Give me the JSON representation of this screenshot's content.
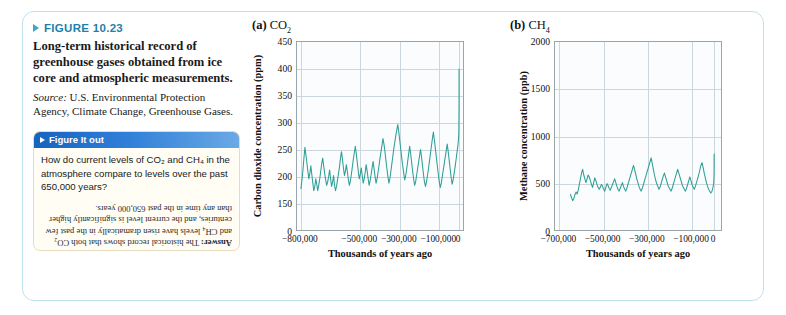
{
  "figure": {
    "number_label": "FIGURE 10.23",
    "caption": "Long-term historical record of greenhouse gases obtained from ice core and atmospheric measurements.",
    "source_label": "Source:",
    "source_text": " U.S. Environmental Protection Agency, Climate Change, Greenhouse Gases.",
    "accent_color": "#1f7fa8",
    "frame_border_color": "#bfe0ef"
  },
  "figure_it_out": {
    "title": "Figure It out",
    "question": "How do current levels of CO₂ and CH₄ in the atmosphere compare to levels over the past 650,000 years?",
    "answer_label": "Answer:",
    "answer_text": " The historical record shows that both CO₂ and CH₄ levels have risen dramatically in the past few centuries, and the current level is significantly higher than any time in the past 650,000 years.",
    "bar_color": "#2f7fd8",
    "box_background": "#fffdf4",
    "box_border": "#e6dcc0"
  },
  "panels": [
    {
      "letter": "(a)",
      "species": "CO",
      "subscript": "2"
    },
    {
      "letter": "(b)",
      "species": "CH",
      "subscript": "4"
    }
  ],
  "chart_data": [
    {
      "type": "line",
      "panel": "(a)",
      "title": "CO2",
      "xlabel": "Thousands of years ago",
      "ylabel": "Carbon dioxide concentration (ppm)",
      "line_color": "#2e9e96",
      "grid": true,
      "legend": "none",
      "xlim": [
        -820000,
        30000
      ],
      "ylim": [
        130,
        450
      ],
      "y_axis_break": true,
      "xticks": [
        -800000,
        -500000,
        -300000,
        -100000,
        0
      ],
      "xtick_labels": [
        "−800,000",
        "−500,000",
        "−300,000",
        "−100,000",
        "0"
      ],
      "yticks": [
        0,
        150,
        200,
        250,
        300,
        350,
        400,
        450
      ],
      "ytick_labels": [
        "0",
        "150",
        "200",
        "250",
        "300",
        "350",
        "400",
        "450"
      ],
      "x": [
        -800000,
        -795000,
        -790000,
        -785000,
        -780000,
        -775000,
        -770000,
        -765000,
        -760000,
        -755000,
        -750000,
        -745000,
        -740000,
        -735000,
        -730000,
        -725000,
        -720000,
        -715000,
        -710000,
        -705000,
        -700000,
        -695000,
        -690000,
        -685000,
        -680000,
        -675000,
        -670000,
        -665000,
        -660000,
        -655000,
        -650000,
        -645000,
        -640000,
        -635000,
        -630000,
        -625000,
        -620000,
        -615000,
        -610000,
        -605000,
        -600000,
        -595000,
        -590000,
        -585000,
        -580000,
        -575000,
        -570000,
        -565000,
        -560000,
        -555000,
        -550000,
        -545000,
        -540000,
        -535000,
        -530000,
        -525000,
        -520000,
        -515000,
        -510000,
        -505000,
        -500000,
        -495000,
        -490000,
        -485000,
        -480000,
        -475000,
        -470000,
        -465000,
        -460000,
        -455000,
        -450000,
        -445000,
        -440000,
        -435000,
        -430000,
        -425000,
        -420000,
        -415000,
        -410000,
        -405000,
        -400000,
        -395000,
        -390000,
        -385000,
        -380000,
        -375000,
        -370000,
        -365000,
        -360000,
        -355000,
        -350000,
        -345000,
        -340000,
        -335000,
        -330000,
        -325000,
        -320000,
        -315000,
        -310000,
        -305000,
        -300000,
        -295000,
        -290000,
        -285000,
        -280000,
        -275000,
        -270000,
        -265000,
        -260000,
        -255000,
        -250000,
        -245000,
        -240000,
        -235000,
        -230000,
        -225000,
        -220000,
        -215000,
        -210000,
        -205000,
        -200000,
        -195000,
        -190000,
        -185000,
        -180000,
        -175000,
        -170000,
        -165000,
        -160000,
        -155000,
        -150000,
        -145000,
        -140000,
        -135000,
        -130000,
        -125000,
        -120000,
        -115000,
        -110000,
        -105000,
        -100000,
        -95000,
        -90000,
        -85000,
        -80000,
        -75000,
        -70000,
        -65000,
        -60000,
        -55000,
        -50000,
        -45000,
        -40000,
        -35000,
        -30000,
        -25000,
        -20000,
        -15000,
        -10000,
        -5000,
        -2000,
        -1000,
        -500,
        -200,
        -100,
        0
      ],
      "y": [
        180,
        196,
        214,
        236,
        256,
        242,
        228,
        212,
        198,
        208,
        222,
        206,
        190,
        176,
        184,
        198,
        188,
        176,
        186,
        198,
        212,
        226,
        236,
        222,
        208,
        196,
        186,
        192,
        202,
        214,
        198,
        184,
        192,
        204,
        186,
        176,
        184,
        196,
        208,
        220,
        236,
        248,
        234,
        218,
        204,
        212,
        224,
        210,
        196,
        186,
        194,
        206,
        220,
        234,
        246,
        258,
        244,
        228,
        212,
        198,
        206,
        218,
        204,
        190,
        198,
        210,
        224,
        212,
        198,
        186,
        194,
        206,
        218,
        230,
        216,
        202,
        190,
        198,
        210,
        222,
        236,
        248,
        260,
        272,
        262,
        248,
        232,
        216,
        202,
        190,
        198,
        212,
        226,
        240,
        254,
        266,
        278,
        288,
        298,
        284,
        268,
        252,
        236,
        222,
        208,
        196,
        204,
        216,
        230,
        244,
        258,
        244,
        228,
        212,
        198,
        186,
        192,
        204,
        216,
        228,
        240,
        252,
        238,
        222,
        206,
        192,
        184,
        192,
        204,
        216,
        230,
        244,
        258,
        272,
        284,
        270,
        254,
        238,
        222,
        206,
        192,
        182,
        190,
        202,
        214,
        226,
        238,
        250,
        262,
        248,
        232,
        216,
        200,
        188,
        196,
        208,
        220,
        234,
        248,
        262,
        276,
        290,
        310,
        340,
        375,
        400,
        412
      ],
      "annotations": [
        {
          "text": "modern spike",
          "x": 0,
          "y": 412,
          "visible": false
        }
      ]
    },
    {
      "type": "line",
      "panel": "(b)",
      "title": "CH4",
      "xlabel": "Thousands of years ago",
      "ylabel": "Methane concentration (ppb)",
      "line_color": "#2e9e96",
      "grid": true,
      "legend": "none",
      "xlim": [
        -720000,
        40000
      ],
      "ylim": [
        0,
        2000
      ],
      "y_axis_break": false,
      "xticks": [
        -700000,
        -500000,
        -300000,
        -100000,
        0
      ],
      "xtick_labels": [
        "−700,000",
        "−500,000",
        "−300,000",
        "−100,000",
        "0"
      ],
      "yticks": [
        0,
        500,
        1000,
        1500,
        2000
      ],
      "ytick_labels": [
        "0",
        "500",
        "1000",
        "1500",
        "2000"
      ],
      "x": [
        -650000,
        -645000,
        -640000,
        -635000,
        -630000,
        -625000,
        -620000,
        -615000,
        -610000,
        -605000,
        -600000,
        -595000,
        -590000,
        -585000,
        -580000,
        -575000,
        -570000,
        -565000,
        -560000,
        -555000,
        -550000,
        -545000,
        -540000,
        -535000,
        -530000,
        -525000,
        -520000,
        -515000,
        -510000,
        -505000,
        -500000,
        -495000,
        -490000,
        -485000,
        -480000,
        -475000,
        -470000,
        -465000,
        -460000,
        -455000,
        -450000,
        -445000,
        -440000,
        -435000,
        -430000,
        -425000,
        -420000,
        -415000,
        -410000,
        -405000,
        -400000,
        -395000,
        -390000,
        -385000,
        -380000,
        -375000,
        -370000,
        -365000,
        -360000,
        -355000,
        -350000,
        -345000,
        -340000,
        -335000,
        -330000,
        -325000,
        -320000,
        -315000,
        -310000,
        -305000,
        -300000,
        -295000,
        -290000,
        -285000,
        -280000,
        -275000,
        -270000,
        -265000,
        -260000,
        -255000,
        -250000,
        -245000,
        -240000,
        -235000,
        -230000,
        -225000,
        -220000,
        -215000,
        -210000,
        -205000,
        -200000,
        -195000,
        -190000,
        -185000,
        -180000,
        -175000,
        -170000,
        -165000,
        -160000,
        -155000,
        -150000,
        -145000,
        -140000,
        -135000,
        -130000,
        -125000,
        -120000,
        -115000,
        -110000,
        -105000,
        -100000,
        -95000,
        -90000,
        -85000,
        -80000,
        -75000,
        -70000,
        -65000,
        -60000,
        -55000,
        -50000,
        -45000,
        -40000,
        -35000,
        -30000,
        -25000,
        -20000,
        -15000,
        -10000,
        -5000,
        -2000,
        -1000,
        -500,
        -200,
        -100,
        0
      ],
      "y": [
        395,
        360,
        330,
        350,
        390,
        420,
        400,
        440,
        500,
        560,
        620,
        660,
        600,
        560,
        520,
        560,
        600,
        580,
        540,
        500,
        470,
        520,
        570,
        540,
        500,
        470,
        450,
        470,
        500,
        480,
        450,
        430,
        470,
        510,
        490,
        460,
        440,
        470,
        500,
        530,
        560,
        520,
        480,
        450,
        430,
        460,
        490,
        520,
        480,
        450,
        430,
        460,
        500,
        540,
        580,
        620,
        660,
        700,
        660,
        610,
        560,
        520,
        480,
        450,
        430,
        460,
        500,
        540,
        580,
        620,
        660,
        700,
        740,
        780,
        720,
        660,
        600,
        550,
        510,
        480,
        450,
        470,
        510,
        550,
        590,
        620,
        580,
        540,
        500,
        470,
        450,
        430,
        460,
        500,
        540,
        580,
        620,
        660,
        620,
        580,
        540,
        500,
        470,
        450,
        430,
        460,
        500,
        540,
        580,
        540,
        500,
        470,
        450,
        480,
        520,
        560,
        600,
        650,
        700,
        730,
        680,
        620,
        570,
        520,
        480,
        450,
        430,
        410,
        430,
        470,
        520,
        570,
        620,
        680,
        780,
        820,
        700,
        560,
        600,
        1830
      ]
    }
  ]
}
